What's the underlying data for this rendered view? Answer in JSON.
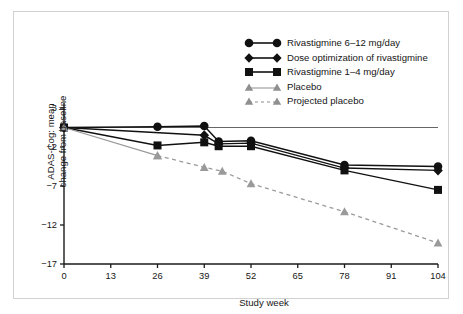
{
  "chart_data": {
    "type": "line",
    "title": "",
    "xlabel": "Study week",
    "ylabel": "ADAS-Cog: mean change from baseline",
    "xlim": [
      0,
      104
    ],
    "ylim": [
      -17,
      3
    ],
    "xticks": [
      0,
      13,
      26,
      39,
      52,
      65,
      78,
      91,
      104
    ],
    "yticks": [
      3,
      -2,
      -7,
      -12,
      -17
    ],
    "ytick_labels": [
      "3",
      "−2",
      "−7",
      "−12",
      "−17"
    ],
    "grid": false,
    "legend_position": "top-right",
    "reference_line": {
      "y": 0.5,
      "x_from": 0,
      "x_to": 104,
      "color": "#555555"
    },
    "series": [
      {
        "name": "Rivastigmine 6–12 mg/day",
        "marker": "circle",
        "color": "#111111",
        "linestyle": "solid",
        "x": [
          0,
          26,
          39,
          43,
          52,
          78,
          104
        ],
        "y": [
          0.5,
          0.6,
          0.7,
          -1.3,
          -1.2,
          -4.3,
          -4.5
        ]
      },
      {
        "name": "Dose optimization of rivastigmine",
        "marker": "diamond",
        "color": "#111111",
        "linestyle": "solid",
        "x": [
          0,
          39,
          43,
          52,
          78,
          104
        ],
        "y": [
          0.5,
          -0.5,
          -1.6,
          -1.5,
          -4.7,
          -5.0
        ]
      },
      {
        "name": "Rivastigmine 1–4 mg/day",
        "marker": "square",
        "color": "#111111",
        "linestyle": "solid",
        "x": [
          0,
          26,
          39,
          43,
          52,
          78,
          104
        ],
        "y": [
          0.5,
          -1.8,
          -1.4,
          -1.9,
          -1.9,
          -5.0,
          -7.5
        ]
      },
      {
        "name": "Placebo",
        "marker": "triangle",
        "color": "#9a9a9a",
        "linestyle": "solid",
        "x": [
          0,
          26
        ],
        "y": [
          0.5,
          -3.1
        ]
      },
      {
        "name": "Projected placebo",
        "marker": "triangle",
        "color": "#9a9a9a",
        "linestyle": "dashed",
        "x": [
          26,
          39,
          44,
          52,
          78,
          104
        ],
        "y": [
          -3.1,
          -4.6,
          -5.1,
          -6.7,
          -10.3,
          -14.3
        ]
      }
    ]
  },
  "legend": {
    "items": [
      {
        "label": "Rivastigmine 6–12 mg/day",
        "marker": "circle",
        "style": "solid",
        "color": "#111111"
      },
      {
        "label": "Dose optimization of rivastigmine",
        "marker": "diamond",
        "style": "solid",
        "color": "#111111"
      },
      {
        "label": "Rivastigmine 1–4 mg/day",
        "marker": "square",
        "style": "solid",
        "color": "#111111"
      },
      {
        "label": "Placebo",
        "marker": "triangle",
        "style": "solid",
        "color": "#9a9a9a"
      },
      {
        "label": "Projected placebo",
        "marker": "triangle",
        "style": "dashed",
        "color": "#9a9a9a"
      }
    ]
  },
  "axes": {
    "x_label": "Study week",
    "y_label_line1": "ADAS-Cog: mean",
    "y_label_line2": "change from baseline",
    "x_tick_labels": [
      "0",
      "13",
      "26",
      "39",
      "52",
      "65",
      "78",
      "91",
      "104"
    ],
    "y_tick_labels": [
      "3",
      "−2",
      "−7",
      "−12",
      "−17"
    ]
  }
}
